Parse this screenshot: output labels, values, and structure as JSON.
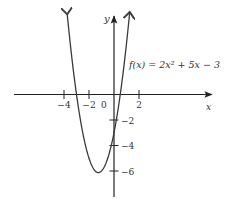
{
  "chart_data": {
    "type": "line",
    "title": "",
    "function_label": "f(x) = 2x² + 5x − 3",
    "xlabel": "x",
    "ylabel": "y",
    "x_ticks": [
      {
        "value": -4,
        "label": "−4"
      },
      {
        "value": -2,
        "label": "−2"
      },
      {
        "value": 2,
        "label": "2"
      }
    ],
    "origin_label": "0",
    "y_ticks": [
      {
        "value": -2,
        "label": "−2"
      },
      {
        "value": -4,
        "label": "−4"
      },
      {
        "value": -6,
        "label": "−6"
      }
    ],
    "series": [
      {
        "name": "f(x) = 2x^2 + 5x - 3",
        "coefficients": {
          "a": 2,
          "b": 5,
          "c": -3
        },
        "vertex": {
          "x": -1.25,
          "y": -6.125
        },
        "roots": [
          -3,
          0.5
        ],
        "y_intercept": -3,
        "x_range": [
          -3.75,
          1.25
        ]
      }
    ],
    "xlim": [
      -8,
      8
    ],
    "ylim": [
      -8,
      6
    ],
    "grid": false,
    "legend": "none",
    "colors": {
      "curve": "#3a3a3a",
      "axis": "#222222",
      "text": "#333333"
    }
  }
}
